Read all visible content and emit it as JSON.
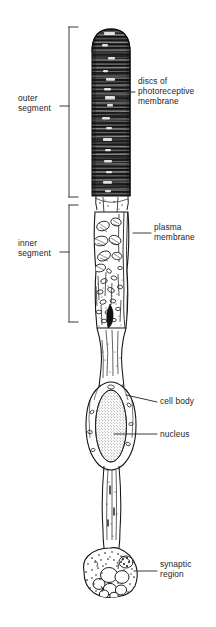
{
  "figure": {
    "background_color": "#ffffff",
    "ink_color": "#1a1a1a"
  },
  "brackets": [
    {
      "id": "outer-segment",
      "label": "outer\nsegment",
      "label_x": 18,
      "label_y": 93,
      "line_x": 69,
      "top_y": 27,
      "bottom_y": 197,
      "tick_y": 106,
      "arm_length": 9
    },
    {
      "id": "inner-segment",
      "label": "inner\nsegment",
      "label_x": 18,
      "label_y": 238,
      "line_x": 69,
      "top_y": 205,
      "bottom_y": 322,
      "tick_y": 252,
      "arm_length": 9
    }
  ],
  "callouts": [
    {
      "id": "discs-of-photoreceptive-membrane",
      "label": "discs of\nphotoreceptive\nmembrane",
      "label_x": 138,
      "label_y": 76,
      "leader": {
        "x1": 127,
        "y1": 92,
        "x2": 135,
        "y2": 92
      }
    },
    {
      "id": "plasma-membrane",
      "label": "plasma\nmembrane",
      "label_x": 154,
      "label_y": 222,
      "leader": {
        "x1": 133,
        "y1": 233,
        "x2": 151,
        "y2": 233
      }
    },
    {
      "id": "cell-body",
      "label": "cell body",
      "label_x": 160,
      "label_y": 396,
      "leader": {
        "x1": 126,
        "y1": 395,
        "x2": 157,
        "y2": 402
      }
    },
    {
      "id": "nucleus",
      "label": "nucleus",
      "label_x": 160,
      "label_y": 429,
      "leader": {
        "x1": 114,
        "y1": 434,
        "x2": 157,
        "y2": 434
      }
    },
    {
      "id": "synaptic-region",
      "label": "synaptic\nregion",
      "label_x": 160,
      "label_y": 559,
      "leader": {
        "x1": 134,
        "y1": 571,
        "x2": 157,
        "y2": 571
      }
    }
  ],
  "structures": {
    "outer_segment": {
      "x_left": 92,
      "x_right": 130,
      "y_top": 29,
      "y_bottom": 196,
      "disc_count": 46
    },
    "connecting_cilium": {
      "y_top": 196,
      "y_bottom": 212
    },
    "inner_segment": {
      "x_left": 93,
      "x_right": 131,
      "y_top": 205,
      "y_bottom": 330
    },
    "axon_upper": {
      "y_top": 330,
      "y_bottom": 386
    },
    "cell_body": {
      "cx": 111,
      "cy": 425,
      "rx": 19,
      "ry": 41
    },
    "nucleus": {
      "cx": 111,
      "cy": 426,
      "rx": 15,
      "ry": 36
    },
    "axon_lower": {
      "y_top": 466,
      "y_bottom": 545
    },
    "synaptic_terminal": {
      "cx": 110,
      "cy": 572,
      "rx": 26,
      "ry": 24,
      "large_vesicles": 7
    }
  }
}
